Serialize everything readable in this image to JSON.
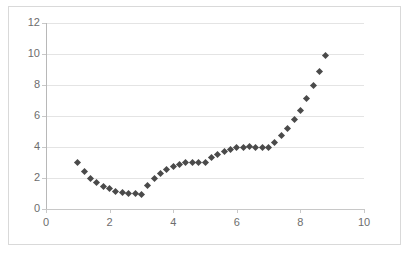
{
  "chart_data": {
    "type": "scatter",
    "title": "",
    "xlabel": "",
    "ylabel": "",
    "xlim": [
      0,
      10
    ],
    "ylim": [
      0,
      12
    ],
    "xticks": [
      0,
      2,
      4,
      6,
      8,
      10
    ],
    "yticks": [
      0,
      2,
      4,
      6,
      8,
      10,
      12
    ],
    "grid": "horizontal",
    "legend": "none",
    "marker": "diamond",
    "marker_color": "#4a4a4a",
    "series": [
      {
        "name": "series1",
        "x": [
          1.0,
          1.2,
          1.4,
          1.6,
          1.8,
          2.0,
          2.2,
          2.4,
          2.6,
          2.8,
          3.0,
          3.2,
          3.4,
          3.6,
          3.8,
          4.0,
          4.2,
          4.4,
          4.6,
          4.8,
          5.0,
          5.2,
          5.4,
          5.6,
          5.8,
          6.0,
          6.2,
          6.4,
          6.6,
          6.8,
          7.0,
          7.2,
          7.4,
          7.6,
          7.8,
          8.0,
          8.2,
          8.4,
          8.6,
          8.8
        ],
        "y": [
          2.98,
          2.45,
          2.0,
          1.72,
          1.45,
          1.3,
          1.15,
          1.05,
          1.0,
          0.98,
          0.95,
          1.5,
          1.98,
          2.3,
          2.55,
          2.72,
          2.85,
          2.97,
          3.0,
          3.0,
          3.02,
          3.3,
          3.5,
          3.72,
          3.85,
          3.95,
          4.0,
          4.02,
          4.0,
          4.0,
          3.98,
          4.3,
          4.72,
          5.2,
          5.78,
          6.35,
          7.12,
          7.95,
          8.85,
          9.88
        ]
      }
    ]
  },
  "axes": {
    "y_tick_labels": [
      "0",
      "2",
      "4",
      "6",
      "8",
      "10",
      "12"
    ],
    "x_tick_labels": [
      "0",
      "2",
      "4",
      "6",
      "8",
      "10"
    ]
  }
}
